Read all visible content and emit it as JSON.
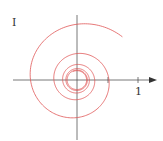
{
  "chart_data": {
    "type": "line",
    "title": "",
    "xlabel": "",
    "ylabel": "I",
    "x_tick_labels": [
      "1"
    ],
    "x_ticks": [
      0.5,
      1
    ],
    "grid": false,
    "legend": null,
    "series": [
      {
        "name": "spiral",
        "color": "#e05555",
        "description": "Curve spiraling inward toward the origin",
        "start": [
          0.8,
          0.82
        ],
        "end": [
          0,
          0
        ]
      }
    ],
    "xlim": [
      -1.05,
      1.25
    ],
    "ylim": [
      -1.0,
      1.1
    ]
  },
  "labels": {
    "y_axis": "I",
    "x_tick_1": "1"
  },
  "colors": {
    "curve": "#e05555",
    "axis": "#555555"
  }
}
